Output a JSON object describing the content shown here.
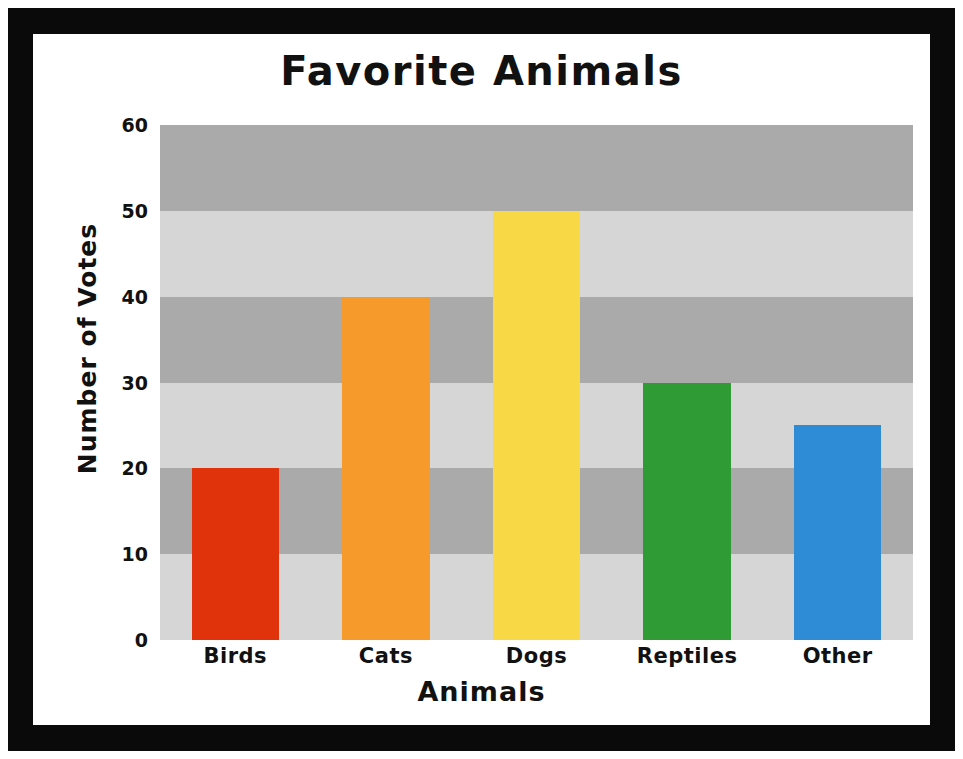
{
  "frame": {
    "border_color": "#0a0a0a",
    "background_color": "#ffffff"
  },
  "chart_data": {
    "type": "bar",
    "title": "Favorite Animals",
    "xlabel": "Animals",
    "ylabel": "Number of Votes",
    "categories": [
      "Birds",
      "Cats",
      "Dogs",
      "Reptiles",
      "Other"
    ],
    "values": [
      20,
      40,
      50,
      30,
      25
    ],
    "bar_colors": [
      "#e0330c",
      "#f59a2b",
      "#f8d945",
      "#2e9b35",
      "#2e8bd6"
    ],
    "ylim": [
      0,
      60
    ],
    "ytick_labels": [
      "0",
      "10",
      "20",
      "30",
      "40",
      "50",
      "60"
    ],
    "ytick_values": [
      0,
      10,
      20,
      30,
      40,
      50,
      60
    ],
    "grid": false,
    "banded_background": true,
    "band_colors": [
      "#d6d6d6",
      "#aaaaaa"
    ],
    "legend": null,
    "legend_position": "none",
    "annotations": []
  }
}
